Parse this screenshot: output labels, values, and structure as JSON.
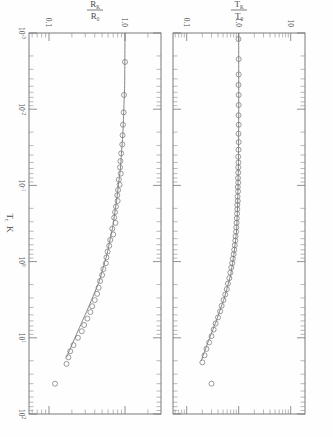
{
  "figure": {
    "title": "",
    "background": "#fefefe",
    "ink": "#6e6e6e",
    "orientation": "rotated-90"
  },
  "axis": {
    "x_label": "Tₑ K",
    "x_label_main": "T",
    "x_label_sub": "c",
    "x_label_unit": "K",
    "x_ticks": [
      "10³⁻",
      "10⁻²",
      "10⁻¹",
      "10⁰",
      "10¹",
      "10²"
    ],
    "x_tick_bases": [
      "10",
      "10",
      "10",
      "10",
      "10",
      "10"
    ],
    "x_tick_exponents": [
      "-3",
      "-2",
      "-1",
      "0",
      "1",
      "2"
    ],
    "x_min_decade": -3,
    "x_max_decade": 2,
    "scale": "log"
  },
  "panels": [
    {
      "id": "panel-top",
      "y_label_num": "T",
      "y_label_num_sub": "K",
      "y_label_den": "T",
      "y_label_den_sub": "0",
      "y_label_text": "T_K / T_0",
      "y_ticks": [
        "10",
        "1.0",
        "0.1"
      ],
      "y_tick_values": [
        10,
        1.0,
        0.1
      ],
      "y_min": 0.05,
      "y_max": 14
    },
    {
      "id": "panel-bottom",
      "y_label_num": "R",
      "y_label_num_sub": "K",
      "y_label_den": "R",
      "y_label_den_sub": "0",
      "y_label_text": "R_K / R_0",
      "y_ticks": [
        "1.0",
        "0.1"
      ],
      "y_tick_values": [
        1.0,
        0.1
      ],
      "y_min": 0.06,
      "y_max": 2.2
    }
  ],
  "chart_data": [
    {
      "type": "scatter",
      "panel": "panel-top",
      "title": "",
      "xlabel": "T_c  K",
      "ylabel": "T_K / T_0",
      "xscale": "log",
      "yscale": "log",
      "xlim": [
        0.001,
        100
      ],
      "ylim": [
        0.05,
        14
      ],
      "grid": false,
      "legend": null,
      "marker": "open-circle",
      "series": [
        {
          "name": "measured T_K/T_0",
          "x": [
            0.0012,
            0.0022,
            0.0035,
            0.0048,
            0.0065,
            0.0088,
            0.012,
            0.016,
            0.021,
            0.027,
            0.034,
            0.042,
            0.05,
            0.058,
            0.068,
            0.08,
            0.092,
            0.105,
            0.12,
            0.14,
            0.16,
            0.18,
            0.205,
            0.235,
            0.27,
            0.31,
            0.355,
            0.405,
            0.465,
            0.53,
            0.61,
            0.7,
            0.8,
            0.92,
            1.05,
            1.2,
            1.4,
            1.65,
            1.95,
            2.3,
            2.7,
            3.2,
            3.8,
            4.5,
            5.4,
            6.5,
            7.8,
            9.5,
            11.5,
            14.0,
            17.0,
            21.0,
            40.0
          ],
          "y": [
            0.99,
            1.0,
            1.0,
            0.99,
            1.0,
            1.0,
            0.99,
            1.0,
            0.99,
            1.0,
            0.99,
            0.98,
            0.99,
            0.98,
            0.98,
            0.97,
            0.98,
            0.96,
            0.97,
            0.95,
            0.96,
            0.94,
            0.94,
            0.93,
            0.92,
            0.91,
            0.9,
            0.89,
            0.87,
            0.86,
            0.84,
            0.82,
            0.8,
            0.77,
            0.75,
            0.72,
            0.69,
            0.66,
            0.62,
            0.59,
            0.55,
            0.51,
            0.47,
            0.44,
            0.4,
            0.36,
            0.33,
            0.3,
            0.27,
            0.24,
            0.22,
            0.2,
            0.3
          ]
        }
      ],
      "fit": {
        "name": "theory curve",
        "x": [
          0.001,
          0.01,
          0.05,
          0.1,
          0.2,
          0.4,
          0.8,
          1.5,
          3.0,
          6.0,
          12.0,
          20.0
        ],
        "y": [
          1.0,
          1.0,
          0.99,
          0.97,
          0.95,
          0.91,
          0.81,
          0.7,
          0.53,
          0.37,
          0.25,
          0.19
        ]
      },
      "outliers": [
        {
          "x": 40.0,
          "y": 0.3,
          "note": "single high-T point above curve"
        }
      ]
    },
    {
      "type": "scatter",
      "panel": "panel-bottom",
      "title": "",
      "xlabel": "T_c  K",
      "ylabel": "R_K / R_0",
      "xscale": "log",
      "yscale": "log",
      "xlim": [
        0.001,
        100
      ],
      "ylim": [
        0.06,
        2.2
      ],
      "grid": false,
      "legend": null,
      "marker": "open-circle",
      "series": [
        {
          "name": "measured R_K/R_0",
          "x": [
            0.0024,
            0.0065,
            0.011,
            0.016,
            0.022,
            0.029,
            0.038,
            0.048,
            0.058,
            0.07,
            0.084,
            0.098,
            0.115,
            0.135,
            0.16,
            0.19,
            0.225,
            0.265,
            0.31,
            0.37,
            0.44,
            0.52,
            0.62,
            0.74,
            0.88,
            1.05,
            1.25,
            1.5,
            1.8,
            2.2,
            2.65,
            3.2,
            3.85,
            4.6,
            5.6,
            6.8,
            8.2,
            10.0,
            12.5,
            15.0,
            18.0,
            22.0,
            40.0
          ],
          "y": [
            1.0,
            0.97,
            0.96,
            0.94,
            0.93,
            0.92,
            0.89,
            0.87,
            0.86,
            0.88,
            0.83,
            0.85,
            0.81,
            0.79,
            0.8,
            0.76,
            0.74,
            0.72,
            0.75,
            0.68,
            0.7,
            0.64,
            0.62,
            0.59,
            0.57,
            0.56,
            0.52,
            0.5,
            0.47,
            0.45,
            0.43,
            0.4,
            0.37,
            0.35,
            0.32,
            0.29,
            0.27,
            0.24,
            0.21,
            0.19,
            0.18,
            0.17,
            0.12
          ],
          "y_scatter_note": "moderate scatter about the fit line"
        }
      ],
      "fit": {
        "name": "theory curve",
        "x": [
          0.001,
          0.005,
          0.02,
          0.06,
          0.15,
          0.35,
          0.8,
          1.8,
          4.0,
          9.0,
          18.0
        ],
        "y": [
          1.0,
          0.99,
          0.94,
          0.87,
          0.78,
          0.69,
          0.58,
          0.46,
          0.33,
          0.23,
          0.17
        ]
      },
      "outliers": [
        {
          "x": 0.0024,
          "y": 1.0,
          "note": "isolated low-T point"
        },
        {
          "x": 40.0,
          "y": 0.12,
          "note": "single high-T point"
        }
      ]
    }
  ]
}
